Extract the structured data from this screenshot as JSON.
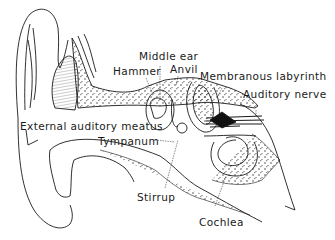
{
  "diagram": {
    "labels": {
      "middle_ear": "Middle ear",
      "hammer": "Hammer",
      "anvil": "Anvil",
      "membranous_labyrinth": "Membranous labyrinth",
      "auditory_nerve": "Auditory nerve",
      "external_auditory_meatus": "External auditory meatus",
      "tympanum": "Tympanum",
      "stirrup": "Stirrup",
      "cochlea": "Cochlea"
    },
    "colors": {
      "ink": "#1a1a1a",
      "background": "#ffffff"
    }
  }
}
